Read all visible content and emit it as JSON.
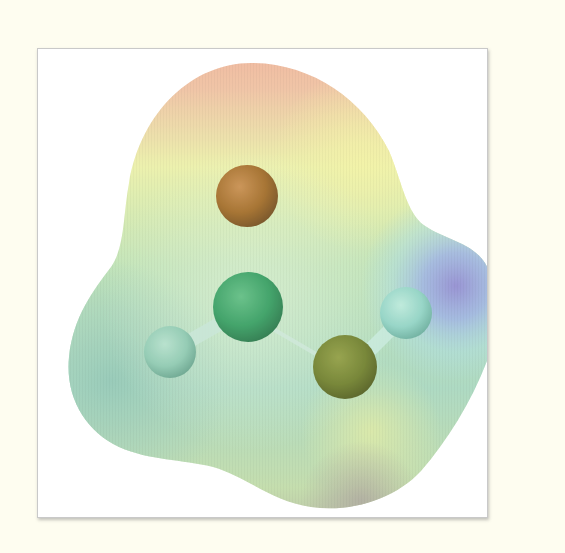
{
  "figure": {
    "background_color": "#fefdf0",
    "frame_color": "#ffffff",
    "frame_border_color": "#c9c9c9"
  },
  "surface": {
    "type": "electron-density-isosurface",
    "color_scale": [
      {
        "label": "most-negative",
        "color": "#f2a08c"
      },
      {
        "label": "negative",
        "color": "#f6f0a0"
      },
      {
        "label": "neutral",
        "color": "#b8e0b0"
      },
      {
        "label": "slightly-positive",
        "color": "#9cd4c4"
      },
      {
        "label": "positive",
        "color": "#a8c8ee"
      },
      {
        "label": "most-positive",
        "color": "#9a8ed8"
      }
    ]
  },
  "atoms": [
    {
      "id": "O_carbonyl",
      "element": "O",
      "color": "#a0651e",
      "cx": 246,
      "cy": 195,
      "r": 31
    },
    {
      "id": "C",
      "element": "C",
      "color": "#2f9a5c",
      "cx": 247,
      "cy": 306,
      "r": 35
    },
    {
      "id": "H_formyl",
      "element": "H",
      "color": "#8cc8b0",
      "cx": 169,
      "cy": 351,
      "r": 26
    },
    {
      "id": "O_hydroxyl",
      "element": "O",
      "color": "#6b7a24",
      "cx": 344,
      "cy": 366,
      "r": 32
    },
    {
      "id": "H_hydroxyl",
      "element": "H",
      "color": "#8ed2c4",
      "cx": 405,
      "cy": 312,
      "r": 26
    }
  ],
  "bonds": [
    {
      "from": "O_carbonyl",
      "to": "C",
      "order": 2
    },
    {
      "from": "C",
      "to": "H_formyl",
      "order": 1
    },
    {
      "from": "C",
      "to": "O_hydroxyl",
      "order": 1
    },
    {
      "from": "O_hydroxyl",
      "to": "H_hydroxyl",
      "order": 1
    }
  ]
}
